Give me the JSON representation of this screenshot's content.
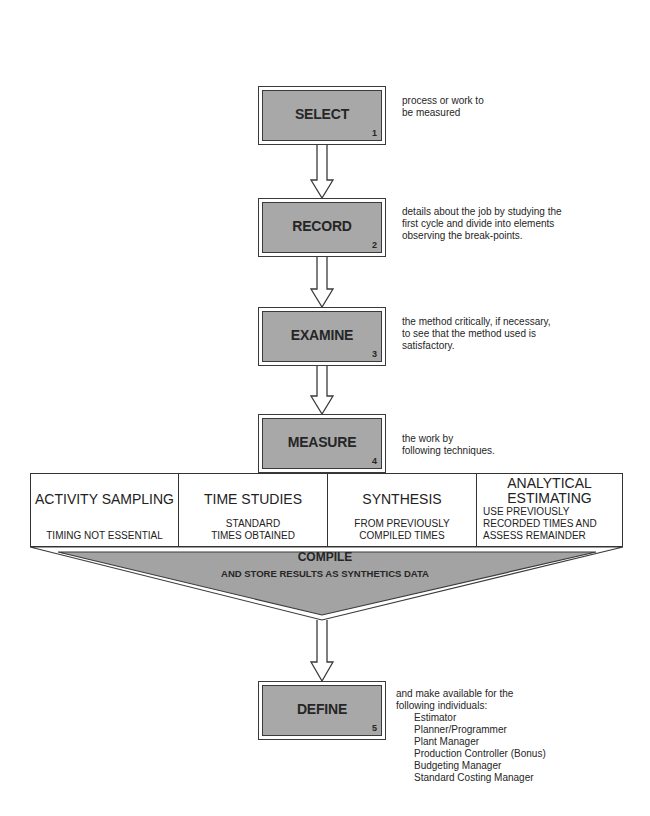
{
  "diagram": {
    "steps": [
      {
        "label": "SELECT",
        "number": "1",
        "description": [
          "process or work to",
          "be measured"
        ]
      },
      {
        "label": "RECORD",
        "number": "2",
        "description": [
          "details about the job by studying the",
          "first cycle and divide into elements",
          "observing the break-points."
        ]
      },
      {
        "label": "EXAMINE",
        "number": "3",
        "description": [
          "the method critically, if necessary,",
          "to see that the method used is",
          "satisfactory."
        ]
      },
      {
        "label": "MEASURE",
        "number": "4",
        "description": [
          "the work by",
          "following techniques."
        ]
      },
      {
        "label": "DEFINE",
        "number": "5",
        "description": [
          "and make available for the",
          "following  individuals:"
        ]
      }
    ],
    "techniques": [
      {
        "title": "ACTIVITY SAMPLING",
        "subtitle": [
          "TIMING NOT ESSENTIAL"
        ]
      },
      {
        "title": "TIME STUDIES",
        "subtitle": [
          "STANDARD",
          "TIMES OBTAINED"
        ]
      },
      {
        "title": "SYNTHESIS",
        "subtitle": [
          "FROM PREVIOUSLY",
          "COMPILED TIMES"
        ]
      },
      {
        "title_lines": [
          "ANALYTICAL",
          "ESTIMATING"
        ],
        "subtitle": [
          "USE PREVIOUSLY",
          "RECORDED TIMES AND",
          "ASSESS REMAINDER"
        ]
      }
    ],
    "compile": {
      "title": "COMPILE",
      "subtitle": "AND STORE RESULTS AS SYNTHETICS DATA"
    },
    "individuals": [
      "Estimator",
      "Planner/Programmer",
      "Plant Manager",
      "Production Controller (Bonus)",
      "Budgeting Manager",
      "Standard Costing Manager"
    ],
    "colors": {
      "box_fill": "#a8a8a8",
      "triangle_fill": "#a3a3a3",
      "line": "#333333",
      "text": "#262626"
    }
  }
}
